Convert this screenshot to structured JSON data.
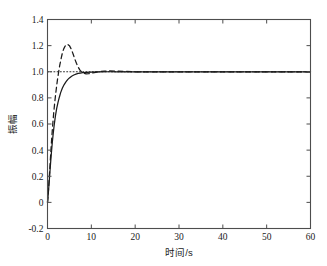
{
  "chart_data": {
    "type": "line",
    "title": "",
    "xlabel": "时间/s",
    "ylabel": "振幅",
    "xlim": [
      0,
      60
    ],
    "ylim": [
      -0.2,
      1.4
    ],
    "xticks": [
      0,
      10,
      20,
      30,
      40,
      50,
      60
    ],
    "xtick_labels": [
      "0",
      "10",
      "20",
      "30",
      "40",
      "50",
      "60"
    ],
    "yticks": [
      -0.2,
      0,
      0.2,
      0.4,
      0.6,
      0.8,
      1.0,
      1.2,
      1.4
    ],
    "ytick_labels": [
      "-0.2",
      "0",
      "0.2",
      "0.4",
      "0.6",
      "0.8",
      "1.0",
      "1.2",
      "1.4"
    ],
    "grid": false,
    "legend": null,
    "legend_position": "none",
    "background_color": "#ffffff",
    "axis_color": "#4d4d4d",
    "line_color": "#1a1a1a",
    "series": [
      {
        "name": "solid-response",
        "style": "solid",
        "color": "#1a1a1a",
        "x": [
          0,
          0.15,
          0.3,
          0.5,
          0.7,
          0.9,
          1.1,
          1.3,
          1.5,
          1.8,
          2.1,
          2.4,
          2.7,
          3.0,
          3.4,
          3.8,
          4.2,
          4.6,
          5.0,
          5.5,
          6.0,
          6.5,
          7.0,
          7.5,
          8.0,
          9.0,
          10.0,
          12.0,
          14.0,
          16.0,
          20.0,
          25.0,
          30.0,
          35.0,
          40.0,
          45.0,
          50.0,
          55.0,
          60.0
        ],
        "y": [
          0.0,
          0.055,
          0.12,
          0.21,
          0.3,
          0.385,
          0.46,
          0.525,
          0.585,
          0.66,
          0.72,
          0.765,
          0.805,
          0.84,
          0.875,
          0.902,
          0.923,
          0.94,
          0.953,
          0.966,
          0.975,
          0.982,
          0.987,
          0.99,
          0.993,
          0.996,
          0.998,
          0.999,
          1.0,
          1.0,
          1.0,
          1.0,
          1.0,
          1.0,
          1.0,
          1.0,
          1.0,
          1.0,
          1.0
        ]
      },
      {
        "name": "dashed-response",
        "style": "dashed",
        "color": "#1a1a1a",
        "x": [
          0,
          0.15,
          0.3,
          0.5,
          0.7,
          0.9,
          1.1,
          1.3,
          1.5,
          1.7,
          1.9,
          2.1,
          2.3,
          2.5,
          2.8,
          3.1,
          3.4,
          3.7,
          4.0,
          4.3,
          4.6,
          5.0,
          5.4,
          5.8,
          6.2,
          6.6,
          7.0,
          7.4,
          7.8,
          8.2,
          8.8,
          9.4,
          10.0,
          11.0,
          12.0,
          13.0,
          14.0,
          16.0,
          18.0,
          20.0,
          25.0,
          30.0,
          35.0,
          40.0,
          45.0,
          50.0,
          55.0,
          60.0
        ],
        "y": [
          0.0,
          0.06,
          0.135,
          0.245,
          0.355,
          0.46,
          0.555,
          0.64,
          0.715,
          0.78,
          0.84,
          0.895,
          0.945,
          0.99,
          1.05,
          1.1,
          1.145,
          1.175,
          1.195,
          1.207,
          1.21,
          1.2,
          1.175,
          1.14,
          1.1,
          1.065,
          1.035,
          1.012,
          0.998,
          0.989,
          0.984,
          0.985,
          0.989,
          0.996,
          1.002,
          1.005,
          1.006,
          1.004,
          1.002,
          1.0,
          1.0,
          1.0,
          1.0,
          1.0,
          1.0,
          1.0,
          1.0,
          1.0
        ]
      },
      {
        "name": "reference-line",
        "style": "dotted",
        "color": "#1a1a1a",
        "x": [
          0,
          60
        ],
        "y": [
          1.0,
          1.0
        ]
      }
    ],
    "annotations": []
  }
}
